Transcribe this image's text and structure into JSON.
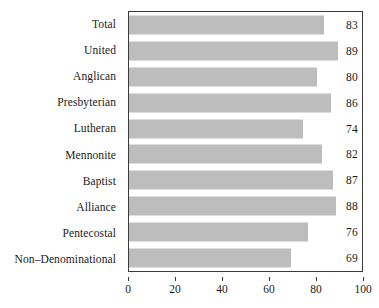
{
  "chart_data": {
    "type": "bar",
    "orientation": "horizontal",
    "title": "",
    "subtitle": "",
    "xlabel": "",
    "ylabel": "",
    "xlim": [
      0,
      100
    ],
    "xticks": [
      0,
      20,
      40,
      60,
      80,
      100
    ],
    "xtick_labels": [
      "0",
      "20",
      "40",
      "60",
      "80",
      "100"
    ],
    "grid": false,
    "legend": null,
    "bar_color": "#bdbdbd",
    "bar_edge_color": "#bdbdbd",
    "axis_color": "#3a3a3a",
    "text_color": "#1a1a1a",
    "background": "#ffffff",
    "value_labels_shown": true,
    "categories": [
      "Total",
      "United",
      "Anglican",
      "Presbyterian",
      "Lutheran",
      "Mennonite",
      "Baptist",
      "Alliance",
      "Pentecostal",
      "Non–Denominational"
    ],
    "values": [
      83,
      89,
      80,
      86,
      74,
      82,
      87,
      88,
      76,
      69
    ],
    "bars": [
      {
        "category": "Total",
        "value": 83,
        "label": "83"
      },
      {
        "category": "United",
        "value": 89,
        "label": "89"
      },
      {
        "category": "Anglican",
        "value": 80,
        "label": "80"
      },
      {
        "category": "Presbyterian",
        "value": 86,
        "label": "86"
      },
      {
        "category": "Lutheran",
        "value": 74,
        "label": "74"
      },
      {
        "category": "Mennonite",
        "value": 82,
        "label": "82"
      },
      {
        "category": "Baptist",
        "value": 87,
        "label": "87"
      },
      {
        "category": "Alliance",
        "value": 88,
        "label": "88"
      },
      {
        "category": "Pentecostal",
        "value": 76,
        "label": "76"
      },
      {
        "category": "Non–Denominational",
        "value": 69,
        "label": "69"
      }
    ]
  }
}
